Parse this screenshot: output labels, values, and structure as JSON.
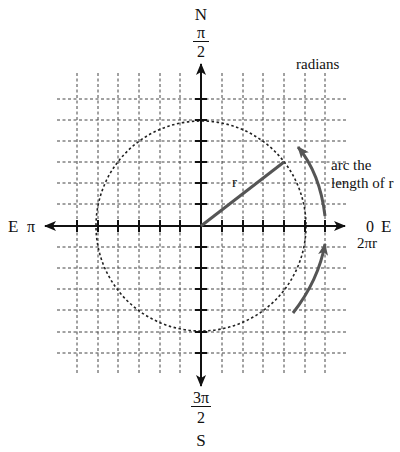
{
  "diagram": {
    "title": "radians",
    "origin": {
      "x": 201,
      "y": 226
    },
    "grid_spacing": 20.8,
    "grid_cells_each_side": 6,
    "circle_radius_units": 5,
    "colors": {
      "axis": "#111111",
      "grid": "#444444",
      "circle": "#222222",
      "radius_line": "#555555",
      "arc_arrow": "#555555",
      "text": "#111111"
    },
    "labels": {
      "north": "N",
      "north_angle_num": "π",
      "north_angle_den": "2",
      "south": "S",
      "south_angle_num": "3π",
      "south_angle_den": "2",
      "west_direction": "E",
      "west_angle": "π",
      "east_angle": "0",
      "east_direction": "E",
      "east_full": "2πr",
      "radius": "r",
      "arc_line1": "arc the",
      "arc_line2": "length of r",
      "title": "radians"
    }
  }
}
